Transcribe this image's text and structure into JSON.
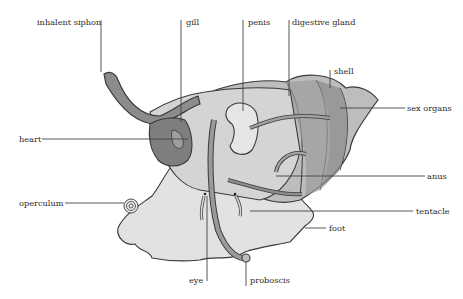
{
  "diagram": {
    "labels": [
      {
        "id": "inhalent-siphon",
        "text": "inhalent siphon"
      },
      {
        "id": "gill",
        "text": "gill"
      },
      {
        "id": "penis",
        "text": "penis"
      },
      {
        "id": "digestive-gland",
        "text": "digestive gland"
      },
      {
        "id": "shell",
        "text": "shell"
      },
      {
        "id": "sex-organs",
        "text": "sex organs"
      },
      {
        "id": "heart",
        "text": "heart"
      },
      {
        "id": "anus",
        "text": "anus"
      },
      {
        "id": "operculum",
        "text": "operculum"
      },
      {
        "id": "tentacle",
        "text": "tentacle"
      },
      {
        "id": "foot",
        "text": "foot"
      },
      {
        "id": "eye",
        "text": "eye"
      },
      {
        "id": "proboscis",
        "text": "proboscis"
      }
    ],
    "colors": {
      "outline": "#3a3a3a",
      "body_light": "#d9d9d9",
      "body_mid": "#b8b8b8",
      "shell_mid": "#9a9a9a",
      "organ_dark": "#777777",
      "leader_line": "#444444"
    }
  }
}
